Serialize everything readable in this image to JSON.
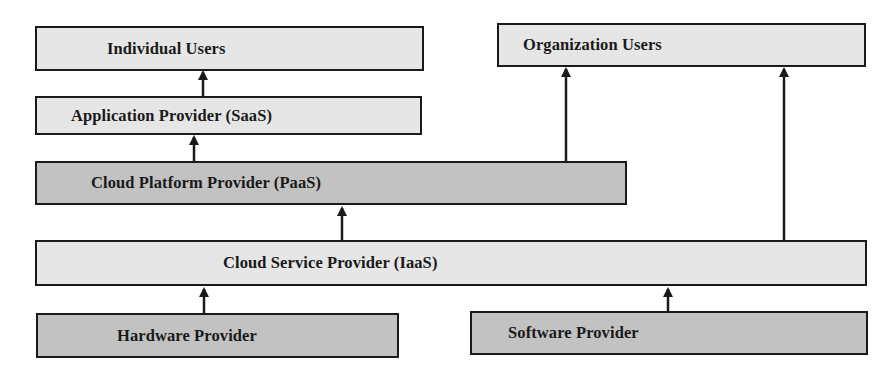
{
  "diagram": {
    "type": "cloud-service-provider-hierarchy",
    "colors": {
      "light_box": "#e6e6e6",
      "dark_box": "#c2c2c2",
      "border": "#1a1a1a",
      "arrow": "#1a1a1a"
    },
    "nodes": {
      "individual_users": "Individual Users",
      "organization_users": "Organization Users",
      "saas": "Application Provider (SaaS)",
      "paas": "Cloud Platform Provider (PaaS)",
      "iaas": "Cloud Service Provider (IaaS)",
      "hardware": "Hardware Provider",
      "software": "Software Provider"
    },
    "edges": [
      {
        "from": "saas",
        "to": "individual_users"
      },
      {
        "from": "paas",
        "to": "saas"
      },
      {
        "from": "paas",
        "to": "organization_users"
      },
      {
        "from": "iaas",
        "to": "paas"
      },
      {
        "from": "iaas",
        "to": "organization_users"
      },
      {
        "from": "hardware",
        "to": "iaas"
      },
      {
        "from": "software",
        "to": "iaas"
      }
    ]
  }
}
